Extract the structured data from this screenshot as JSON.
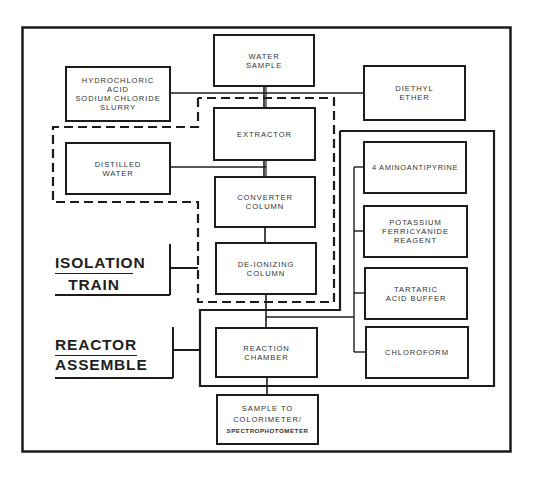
{
  "diagram": {
    "type": "process-flow",
    "boxes": {
      "water_sample": "WATER\nSAMPLE",
      "hcl_slurry": "HYDROCHLORIC\nACID\nSODIUM CHLORIDE\nSLURRY",
      "diethyl_ether": "DIETHYL\nETHER",
      "extractor": "EXTRACTOR",
      "distilled_water": "DISTILLED\nWATER",
      "converter_column": "CONVERTER\nCOLUMN",
      "deionizing_column": "DE-IONIZING\nCOLUMN",
      "aminoantipyrine": "4 AMINOANTIPYRINE",
      "potassium_ferricyanide": "POTASSIUM\nFERRICYANIDE\nREAGENT",
      "tartaric_acid": "TARTARIC\nACID BUFFER",
      "chloroform": "CHLOROFORM",
      "reaction_chamber": "REACTION\nCHAMBER",
      "sample_to_colorimeter_line1": "SAMPLE TO",
      "sample_to_colorimeter_line2": "COLORIMETER/",
      "sample_to_colorimeter_line3": "SPECTROPHOTOMETER"
    },
    "group_labels": {
      "isolation_top": "ISOLATION",
      "isolation_bottom": "TRAIN",
      "reactor_top": "REACTOR",
      "reactor_bottom": "ASSEMBLE"
    },
    "colors": {
      "line": "#1c1c1c",
      "text": "#333333",
      "background": "#ffffff"
    }
  }
}
